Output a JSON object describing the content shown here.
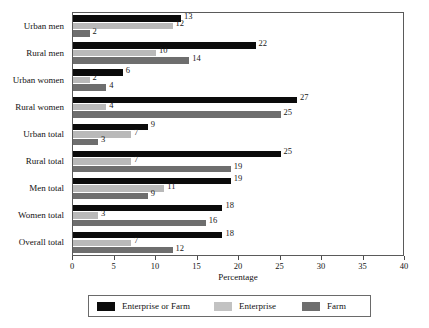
{
  "chart_data": {
    "type": "bar",
    "orientation": "horizontal",
    "title": "",
    "xlabel": "Percentage",
    "ylabel": "",
    "xlim": [
      0,
      40
    ],
    "xticks": [
      0,
      5,
      10,
      15,
      20,
      25,
      30,
      35,
      40
    ],
    "grid": false,
    "legend_position": "bottom",
    "categories": [
      "Urban men",
      "Rural men",
      "Urban women",
      "Rural women",
      "Urban total",
      "Rural total",
      "Men total",
      "Women total",
      "Overall total"
    ],
    "series": [
      {
        "name": "Enterprise or Farm",
        "color": "#0b0b0b",
        "values": [
          13,
          22,
          6,
          27,
          9,
          25,
          19,
          18,
          18
        ]
      },
      {
        "name": "Enterprise",
        "color": "#b9b9b9",
        "values": [
          12,
          10,
          2,
          4,
          7,
          7,
          11,
          3,
          7
        ]
      },
      {
        "name": "Farm",
        "color": "#6e6e6e",
        "values": [
          2,
          14,
          4,
          25,
          3,
          19,
          9,
          16,
          12
        ]
      }
    ]
  },
  "legend": {
    "items": [
      {
        "label": "Enterprise or Farm",
        "color": "#0b0b0b"
      },
      {
        "label": "Enterprise",
        "color": "#c2c2c2"
      },
      {
        "label": "Farm",
        "color": "#6e6e6e"
      }
    ]
  }
}
